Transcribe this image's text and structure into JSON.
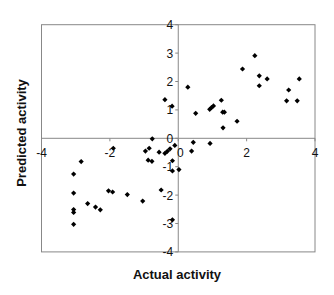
{
  "chart_data": {
    "type": "scatter",
    "title": "",
    "xlabel": "Actual activity",
    "ylabel": "Predicted activity",
    "xlim": [
      -4,
      4
    ],
    "ylim": [
      -4,
      4
    ],
    "x_ticks": [
      -4,
      -2,
      0,
      2,
      4
    ],
    "y_ticks": [
      -4,
      -3,
      -2,
      -1,
      0,
      1,
      2,
      3,
      4
    ],
    "grid": false,
    "legend": null,
    "marker": "diamond",
    "marker_color": "#000000",
    "series": [
      {
        "name": "compounds",
        "points": [
          [
            -3.06,
            -1.26
          ],
          [
            -3.06,
            -1.93
          ],
          [
            -3.06,
            -2.51
          ],
          [
            -3.06,
            -2.61
          ],
          [
            -3.06,
            -3.03
          ],
          [
            -2.84,
            -0.82
          ],
          [
            -2.65,
            -2.3
          ],
          [
            -2.42,
            -2.42
          ],
          [
            -2.28,
            -2.52
          ],
          [
            -2.04,
            -1.85
          ],
          [
            -1.92,
            -1.89
          ],
          [
            -1.9,
            -0.35
          ],
          [
            -1.49,
            -1.98
          ],
          [
            -1.04,
            -2.21
          ],
          [
            -0.96,
            -0.45
          ],
          [
            -0.88,
            -0.77
          ],
          [
            -0.85,
            -0.35
          ],
          [
            -0.77,
            -0.81
          ],
          [
            -0.76,
            -0.02
          ],
          [
            -0.56,
            -0.49
          ],
          [
            -0.5,
            -1.82
          ],
          [
            -0.39,
            1.36
          ],
          [
            -0.39,
            -0.53
          ],
          [
            -0.32,
            -0.46
          ],
          [
            -0.24,
            -0.37
          ],
          [
            -0.18,
            1.13
          ],
          [
            -0.17,
            -0.79
          ],
          [
            -0.17,
            -1.15
          ],
          [
            -0.17,
            -2.87
          ],
          [
            -0.1,
            -0.25
          ],
          [
            0.02,
            -1.1
          ],
          [
            0.28,
            1.8
          ],
          [
            0.39,
            -0.45
          ],
          [
            0.44,
            -0.14
          ],
          [
            0.51,
            0.88
          ],
          [
            0.92,
            1.02
          ],
          [
            0.93,
            -0.18
          ],
          [
            0.97,
            1.08
          ],
          [
            1.03,
            1.14
          ],
          [
            1.26,
            1.34
          ],
          [
            1.3,
            0.92
          ],
          [
            1.31,
            0.37
          ],
          [
            1.35,
            0.92
          ],
          [
            1.72,
            0.6
          ],
          [
            1.88,
            2.44
          ],
          [
            2.24,
            2.91
          ],
          [
            2.37,
            2.2
          ],
          [
            2.37,
            1.85
          ],
          [
            2.6,
            2.09
          ],
          [
            3.17,
            1.32
          ],
          [
            3.23,
            1.7
          ],
          [
            3.48,
            1.32
          ],
          [
            3.54,
            2.09
          ]
        ]
      }
    ]
  },
  "layout": {
    "plot_left": 41.5,
    "plot_right": 315,
    "plot_top": 24.7,
    "plot_bottom": 251.9
  }
}
